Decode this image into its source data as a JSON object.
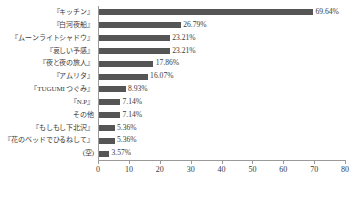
{
  "chart_data": {
    "type": "bar",
    "orientation": "horizontal",
    "title": "",
    "subtitle": "",
    "xlabel": "",
    "ylabel": "",
    "xlim": [
      0,
      80
    ],
    "xticks": [
      0,
      10,
      20,
      30,
      40,
      50,
      60,
      70,
      80
    ],
    "grid": false,
    "legend": false,
    "bar_color": "#555555",
    "axis_color": "#9a9a9a",
    "categories": [
      "『キッチン』",
      "『白河夜船』",
      "『ムーンライトシャドウ』",
      "『哀しい予感』",
      "『夜と夜の旅人』",
      "『アムリタ』",
      "『TUGUMI つぐみ』",
      "『N.P』",
      "その他",
      "『もしもし下北沢』",
      "『花のベッドでひるねして』",
      "(空)"
    ],
    "values": [
      69.64,
      26.79,
      23.21,
      23.21,
      17.86,
      16.07,
      8.93,
      7.14,
      7.14,
      5.36,
      5.36,
      3.57
    ],
    "data_labels": [
      "69.64%",
      "26.79%",
      "23.21%",
      "23.21%",
      "17.86%",
      "16.07%",
      "8.93%",
      "7.14%",
      "7.14%",
      "5.36%",
      "5.36%",
      "3.57%"
    ],
    "tick_labels": [
      "0",
      "10",
      "20",
      "30",
      "40",
      "50",
      "60",
      "70",
      "80"
    ]
  }
}
